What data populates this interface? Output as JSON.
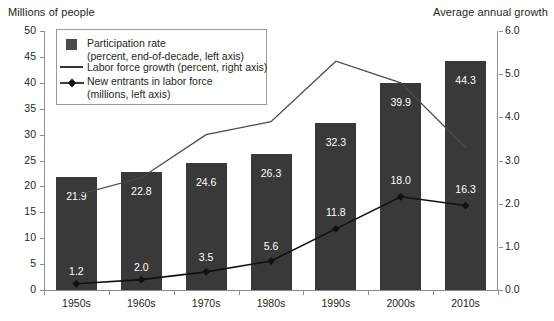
{
  "chart_data": {
    "type": "bar",
    "title": "",
    "categories": [
      "1950s",
      "1960s",
      "1970s",
      "1980s",
      "1990s",
      "2000s",
      "2010s"
    ],
    "ylabel": "Millions of people",
    "ylabel_right": "Average annual growth",
    "xlabel": "",
    "ylim": [
      0,
      50
    ],
    "ylim_right": [
      0,
      6.0
    ],
    "yticks": [
      "0",
      "5",
      "10",
      "15",
      "20",
      "25",
      "30",
      "35",
      "40",
      "45",
      "50"
    ],
    "yticks_right": [
      "0.0",
      "1.0",
      "2.0",
      "3.0",
      "4.0",
      "5.0",
      "6.0"
    ],
    "grid": false,
    "legend_position": "upper-left",
    "series": [
      {
        "name": "Participation rate",
        "sublabel": "(percent, end-of-decade, left axis)",
        "type": "bar",
        "axis": "left",
        "color": "#393939",
        "values": [
          21.9,
          22.8,
          24.6,
          26.3,
          32.3,
          39.9,
          44.3
        ],
        "labels": [
          "21.9",
          "22.8",
          "24.6",
          "26.3",
          "32.3",
          "39.9",
          "44.3"
        ]
      },
      {
        "name": "Labor force growth (percent, right axis)",
        "sublabel": "",
        "type": "line",
        "axis": "right",
        "color": "#4a4a4a",
        "values": [
          2.2,
          2.6,
          3.6,
          3.9,
          5.3,
          4.8,
          3.3
        ],
        "labels": [
          "",
          "",
          "",
          "",
          "",
          "",
          ""
        ]
      },
      {
        "name": "New entrants in labor force",
        "sublabel": "(millions, left axis)",
        "type": "line-marker",
        "axis": "left",
        "color": "#111111",
        "values": [
          1.2,
          2.0,
          3.5,
          5.6,
          11.8,
          18.0,
          16.3
        ],
        "labels": [
          "1.2",
          "2.0",
          "3.5",
          "5.6",
          "11.8",
          "18.0",
          "16.3"
        ]
      }
    ]
  },
  "legend": {
    "items": [
      {
        "label": "Participation rate",
        "sublabel": "(percent, end-of-decade, left axis)",
        "marker": "square-swatch"
      },
      {
        "label": "Labor force growth (percent, right axis)",
        "sublabel": "",
        "marker": "line"
      },
      {
        "label": "New entrants in labor force",
        "sublabel": "(millions, left axis)",
        "marker": "line-diamond"
      }
    ]
  }
}
